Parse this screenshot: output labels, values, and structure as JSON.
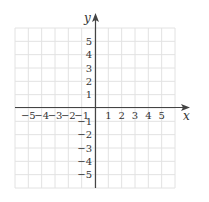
{
  "chart_data": {
    "type": "coordinate-grid",
    "title": "",
    "xlabel": "x",
    "ylabel": "y",
    "xlim": [
      -6,
      6
    ],
    "ylim": [
      -6,
      6
    ],
    "grid": true,
    "x_ticks": [
      "-5",
      "-4",
      "-3",
      "-2",
      "-1",
      "1",
      "2",
      "3",
      "4",
      "5"
    ],
    "y_ticks": [
      "5",
      "4",
      "3",
      "2",
      "1",
      "-1",
      "-2",
      "-3",
      "-4",
      "-5"
    ],
    "x_tick_values": [
      -5,
      -4,
      -3,
      -2,
      -1,
      1,
      2,
      3,
      4,
      5
    ],
    "y_tick_values": [
      5,
      4,
      3,
      2,
      1,
      -1,
      -2,
      -3,
      -4,
      -5
    ],
    "series": []
  },
  "labels": {
    "x_axis": "x",
    "y_axis": "y",
    "x_ticks_display": [
      "−5",
      "−4",
      "−3",
      "−2",
      "−1",
      "1",
      "2",
      "3",
      "4",
      "5"
    ],
    "y_ticks_display": [
      "5",
      "4",
      "3",
      "2",
      "1",
      "−1",
      "−2",
      "−3",
      "−4",
      "−5"
    ]
  },
  "colors": {
    "grid": "#e2e2e2",
    "axis": "#444444",
    "text": "#333333"
  }
}
